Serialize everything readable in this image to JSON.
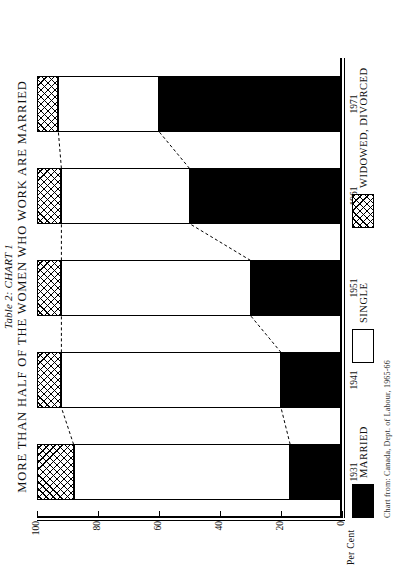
{
  "figure": {
    "table_label": "Table 2:  CHART 1",
    "title": "MORE THAN HALF OF THE WOMEN WHO WORK ARE MARRIED",
    "source_note": "Chart from: Canada, Dept. of Labour, 1965-66"
  },
  "axis": {
    "y_title": "Per Cent",
    "y_ticks": [
      "0",
      "20",
      "40",
      "60",
      "80",
      "100"
    ]
  },
  "legend": {
    "items": [
      {
        "label": "MARRIED",
        "pattern": "solid-black",
        "color": "#000000"
      },
      {
        "label": "SINGLE",
        "pattern": "white",
        "color": "#ffffff"
      },
      {
        "label": "WIDOWED, DIVORCED",
        "pattern": "cross-hatch",
        "color": "#000000"
      }
    ]
  },
  "chart_data": {
    "type": "bar",
    "title": "MORE THAN HALF OF THE WOMEN WHO WORK ARE MARRIED",
    "subtitle": "Table 2:  CHART 1",
    "xlabel": "",
    "ylabel": "Per Cent",
    "ylim": [
      0,
      100
    ],
    "yticks": [
      0,
      20,
      40,
      60,
      80,
      100
    ],
    "grid": false,
    "stacked": true,
    "legend_position": "bottom",
    "categories": [
      "1931",
      "1941",
      "1951",
      "1961",
      "1971"
    ],
    "series": [
      {
        "name": "MARRIED",
        "values": [
          17,
          20,
          30,
          50,
          60
        ]
      },
      {
        "name": "SINGLE",
        "values": [
          71,
          72,
          62,
          42,
          33
        ]
      },
      {
        "name": "WIDOWED, DIVORCED",
        "values": [
          12,
          8,
          8,
          8,
          7
        ]
      }
    ],
    "annotations": [
      "Dashed connector lines join the tops of the MARRIED segments across years",
      "Dashed connector lines join the bottoms of the WIDOWED, DIVORCED segments across years"
    ]
  }
}
